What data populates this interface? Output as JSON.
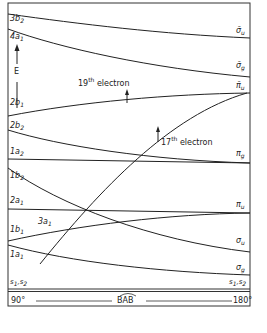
{
  "diagram": {
    "energy_axis_label": "E",
    "left_labels": [
      "3b2",
      "4a1",
      "2b1",
      "2b2",
      "1a2",
      "1b2",
      "2a1",
      "1b1",
      "1a1",
      "s1,s2"
    ],
    "right_labels": [
      "σ̄u",
      "σ̄g",
      "π̄u",
      "πg",
      "πu",
      "σu",
      "σg",
      "s1,s2"
    ],
    "inner_labels": {
      "a1_3": "3a1",
      "electron_19": "19th electron",
      "electron_17": "17th electron"
    },
    "x_axis": {
      "left": "90°",
      "center": "BAB",
      "right": "180°"
    },
    "caption": "Fig. 2.4 — Correlation diagram"
  },
  "labels": {
    "b2_3": "3b",
    "b2_3_sub": "2",
    "a1_4": "4a",
    "a1_4_sub": "1",
    "E": "E",
    "b1_2": "2b",
    "b1_2_sub": "1",
    "b2_2": "2b",
    "b2_2_sub": "2",
    "a2_1": "1a",
    "a2_1_sub": "2",
    "b2_1": "1b",
    "b2_1_sub": "2",
    "a1_2": "2a",
    "a1_2_sub": "1",
    "b1_1": "1b",
    "b1_1_sub": "1",
    "a1_1": "1a",
    "a1_1_sub": "1",
    "a1_3": "3a",
    "a1_3_sub": "1",
    "s_left": "s",
    "sigma_u_bar": "σ̄",
    "sigma_u_bar_sub": "u",
    "sigma_g_bar": "σ̄",
    "sigma_g_bar_sub": "g",
    "pi_u_bar": "π̄",
    "pi_u_bar_sub": "u",
    "pi_g": "π",
    "pi_g_sub": "g",
    "pi_u": "π",
    "pi_u_sub": "u",
    "sigma_u": "σ",
    "sigma_u_sub": "u",
    "sigma_g": "σ",
    "sigma_g_sub": "g",
    "e19_num": "19",
    "e19_sup": "th",
    "e19_word": " electron",
    "e17_num": "17",
    "e17_sup": "th",
    "e17_word": " electron",
    "deg90": "90°",
    "bab": "BAB",
    "deg180": "180°"
  }
}
